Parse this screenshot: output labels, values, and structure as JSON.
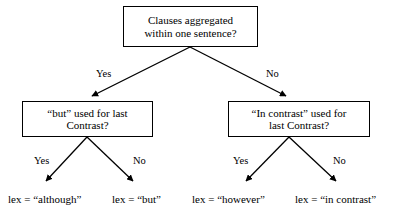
{
  "figure": {
    "type": "decision-tree",
    "colors": {
      "background": "#ffffff",
      "box_border": "#000000",
      "text": "#000000",
      "edge": "#000000"
    }
  },
  "nodes": {
    "root": {
      "line1": "Clauses aggregated",
      "line2": "within one sentence?"
    },
    "left": {
      "line1": "“but” used for last",
      "line2": "Contrast?"
    },
    "right": {
      "line1": "“In contrast” used for",
      "line2": "last Contrast?"
    }
  },
  "edge_labels": {
    "root_yes": "Yes",
    "root_no": "No",
    "left_yes": "Yes",
    "left_no": "No",
    "right_yes": "Yes",
    "right_no": "No"
  },
  "leaves": {
    "although": "lex = “although”",
    "but": "lex = “but”",
    "however": "lex = “however”",
    "in_contrast": "lex = “in contrast”"
  }
}
